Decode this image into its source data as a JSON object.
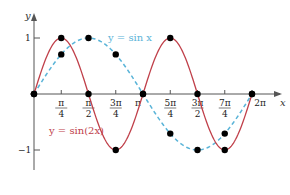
{
  "chart_data": {
    "type": "line",
    "title": "",
    "xlabel": "x",
    "ylabel": "y",
    "xlim": [
      0,
      6.2832
    ],
    "ylim": [
      -1,
      1
    ],
    "grid": false,
    "x_tick_labels": [
      "π/4",
      "π/2",
      "3π/4",
      "π",
      "5π/4",
      "3π/2",
      "7π/4",
      "2π"
    ],
    "x_ticks": [
      0.7854,
      1.5708,
      2.3562,
      3.1416,
      3.927,
      4.7124,
      5.4978,
      6.2832
    ],
    "y_tick_labels": [
      "1",
      "−1"
    ],
    "y_ticks": [
      1,
      -1
    ],
    "series": [
      {
        "name": "y = sin x",
        "style": "dashed",
        "color": "#5ab4d8",
        "marked_points": {
          "x": [
            0,
            0.7854,
            1.5708,
            2.3562,
            3.1416,
            3.927,
            4.7124,
            5.4978,
            6.2832
          ],
          "y": [
            0,
            0.7071,
            1,
            0.7071,
            0,
            -0.7071,
            -1,
            -0.7071,
            0
          ]
        }
      },
      {
        "name": "y = sin(2x)",
        "style": "solid",
        "color": "#c0404a",
        "marked_points": {
          "x": [
            0,
            0.7854,
            1.5708,
            2.3562,
            3.1416,
            3.927,
            4.7124,
            5.4978,
            6.2832
          ],
          "y": [
            0,
            1,
            0,
            -1,
            0,
            1,
            0,
            -1,
            0
          ]
        }
      }
    ],
    "annotations": [
      {
        "text": "y = sin x",
        "near_x": 3.4,
        "near_y": 0.95,
        "color": "#5ab4d8"
      },
      {
        "text": "y = sin(2x)",
        "near_x": 1.3,
        "near_y": -0.55,
        "color": "#c0404a"
      }
    ],
    "legend_position": "inline"
  },
  "labels": {
    "y_axis": "y",
    "x_axis": "x",
    "y_one": "1",
    "y_neg_one": "−1",
    "sin_label": "y = sin x",
    "sin2_label": "y = sin(2x)",
    "ticks": [
      {
        "num": "π",
        "den": "4"
      },
      {
        "num": "π",
        "den": "2"
      },
      {
        "num": "3π",
        "den": "4"
      },
      {
        "num": "π",
        "den": ""
      },
      {
        "num": "5π",
        "den": "4"
      },
      {
        "num": "3π",
        "den": "2"
      },
      {
        "num": "7π",
        "den": "4"
      },
      {
        "num": "2π",
        "den": ""
      }
    ]
  },
  "colors": {
    "sin": "#5ab4d8",
    "sin2": "#c0404a",
    "axis": "#555555",
    "points": "#000000"
  }
}
